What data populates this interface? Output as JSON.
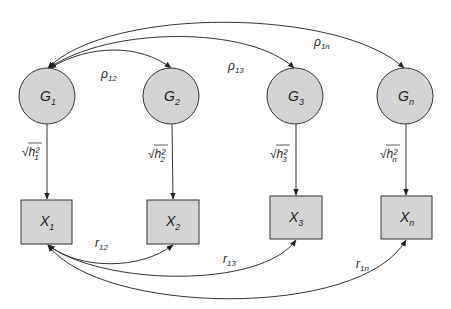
{
  "diagram": {
    "type": "path-diagram",
    "colors": {
      "node_fill": "#d4d4d4",
      "stroke": "#333333",
      "background": "#ffffff"
    },
    "latent_nodes": [
      {
        "id": "G1",
        "base": "G",
        "sub": "1"
      },
      {
        "id": "G2",
        "base": "G",
        "sub": "2"
      },
      {
        "id": "G3",
        "base": "G",
        "sub": "3"
      },
      {
        "id": "Gn",
        "base": "G",
        "sub": "n"
      }
    ],
    "observed_nodes": [
      {
        "id": "X1",
        "base": "X",
        "sub": "1"
      },
      {
        "id": "X2",
        "base": "X",
        "sub": "2"
      },
      {
        "id": "X3",
        "base": "X",
        "sub": "3"
      },
      {
        "id": "Xn",
        "base": "X",
        "sub": "n"
      }
    ],
    "loadings": [
      {
        "from": "G1",
        "to": "X1",
        "label": "√h²",
        "sub": "1"
      },
      {
        "from": "G2",
        "to": "X2",
        "label": "√h²",
        "sub": "2"
      },
      {
        "from": "G3",
        "to": "X3",
        "label": "√h²",
        "sub": "3"
      },
      {
        "from": "Gn",
        "to": "Xn",
        "label": "√h²",
        "sub": "n"
      }
    ],
    "latent_correlations": [
      {
        "from": "G1",
        "to": "G2",
        "base": "ρ",
        "sub": "12"
      },
      {
        "from": "G1",
        "to": "G3",
        "base": "ρ",
        "sub": "13"
      },
      {
        "from": "G1",
        "to": "Gn",
        "base": "ρ",
        "sub": "1n"
      }
    ],
    "observed_correlations": [
      {
        "from": "X1",
        "to": "X2",
        "base": "r",
        "sub": "12"
      },
      {
        "from": "X1",
        "to": "X3",
        "base": "r",
        "sub": "13"
      },
      {
        "from": "X1",
        "to": "Xn",
        "base": "r",
        "sub": "1n"
      }
    ]
  }
}
